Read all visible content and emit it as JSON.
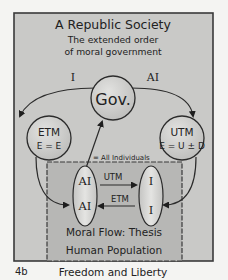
{
  "diagram": {
    "title": "A Republic Society",
    "subtitle_line1": "The extended order",
    "subtitle_line2": "of moral government",
    "arc_left_label": "I",
    "arc_right_label": "AI",
    "center_node": "Gov.",
    "left_node": {
      "title": "ETM",
      "formula": "E = E"
    },
    "right_node": {
      "title": "UTM",
      "formula": "E = U ± D"
    },
    "annotation": "= All Individuals",
    "population_box": {
      "left_ellipse": {
        "top": "AI",
        "bottom": "AI"
      },
      "right_ellipse": {
        "top": "I",
        "bottom": "I"
      },
      "arrow_right_label": "UTM",
      "arrow_left_label": "ETM",
      "caption_line1": "Moral Flow: Thesis",
      "caption_line2": "Human Population"
    },
    "figure_number": "4b",
    "figure_caption": "Freedom and Liberty"
  },
  "colors": {
    "outer_fill": "#c9c9c7",
    "inner_fill": "#b7b7b5",
    "node_fill": "#cfcfcd",
    "ellipse_fill": "#d8d8d6",
    "stroke": "#2b2b2b",
    "text": "#222222"
  }
}
